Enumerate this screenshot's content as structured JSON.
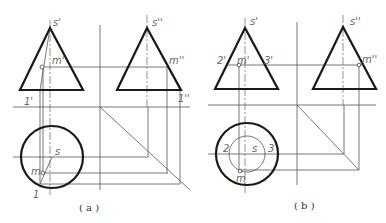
{
  "figure_a": {
    "caption": "( a )",
    "labels": {
      "s_front": "s'",
      "m_front": "m'",
      "one_front": "1'",
      "s_side": "s''",
      "m_side": "m''",
      "one_side": "1''",
      "s_top": "s",
      "m_top": "m",
      "one_top": "1"
    }
  },
  "figure_b": {
    "caption": "( b )",
    "labels": {
      "s_front": "s'",
      "m_front": "m'",
      "two_front": "2'",
      "three_front": "3'",
      "s_side": "s''",
      "m_side": "m''",
      "s_top": "s",
      "m_top": "m",
      "two_top": "2",
      "three_top": "3"
    }
  },
  "colors": {
    "outline": "#1a1a1a",
    "construction": "#555555",
    "label": "#666666"
  }
}
